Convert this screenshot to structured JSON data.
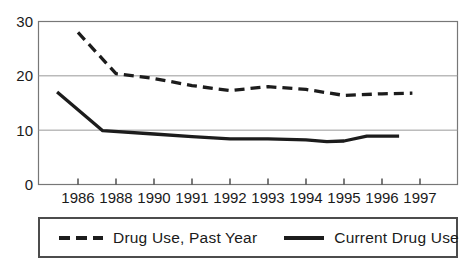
{
  "chart_data": {
    "type": "line",
    "title": "",
    "xlabel": "",
    "ylabel": "",
    "categories": [
      "1986",
      "1988",
      "1990",
      "1991",
      "1992",
      "1993",
      "1994",
      "1995",
      "1996",
      "1997"
    ],
    "y_ticks": [
      0,
      10,
      20,
      30
    ],
    "ylim": [
      0,
      30
    ],
    "grid": "horizontal",
    "legend_position": "bottom-boxed",
    "series": [
      {
        "name": "Drug Use, Past Year",
        "style": "dashed",
        "color": "#1c1c1c",
        "values": [
          28,
          20.5,
          19.5,
          18,
          17.5,
          18,
          17.5,
          16.5,
          16.5,
          16.5
        ],
        "render_points": [
          [
            0,
            28
          ],
          [
            1,
            20.4
          ],
          [
            2,
            19.5
          ],
          [
            3,
            18.2
          ],
          [
            4,
            17.3
          ],
          [
            5,
            18.0
          ],
          [
            6,
            17.5
          ],
          [
            7,
            16.4
          ],
          [
            8,
            16.7
          ],
          [
            8.8,
            16.8
          ]
        ]
      },
      {
        "name": "Current Drug Use",
        "style": "solid",
        "color": "#1c1c1c",
        "values": [
          16.5,
          10,
          9,
          8.5,
          8.5,
          8.5,
          8,
          8,
          8.5,
          8.5
        ],
        "render_points": [
          [
            -0.55,
            17.0
          ],
          [
            0.65,
            9.9
          ],
          [
            2,
            9.3
          ],
          [
            3,
            8.8
          ],
          [
            4,
            8.4
          ],
          [
            5,
            8.4
          ],
          [
            6,
            8.2
          ],
          [
            6.55,
            7.9
          ],
          [
            7,
            8.0
          ],
          [
            7.6,
            8.9
          ],
          [
            8.45,
            8.9
          ]
        ]
      }
    ]
  },
  "colors": {
    "line": "#1c1c1c",
    "grid": "#999999",
    "plot_border": "#777777",
    "tick": "#444444",
    "text": "#1a1a1a",
    "legend_border": "#4c4c4c",
    "background": "#ffffff"
  }
}
